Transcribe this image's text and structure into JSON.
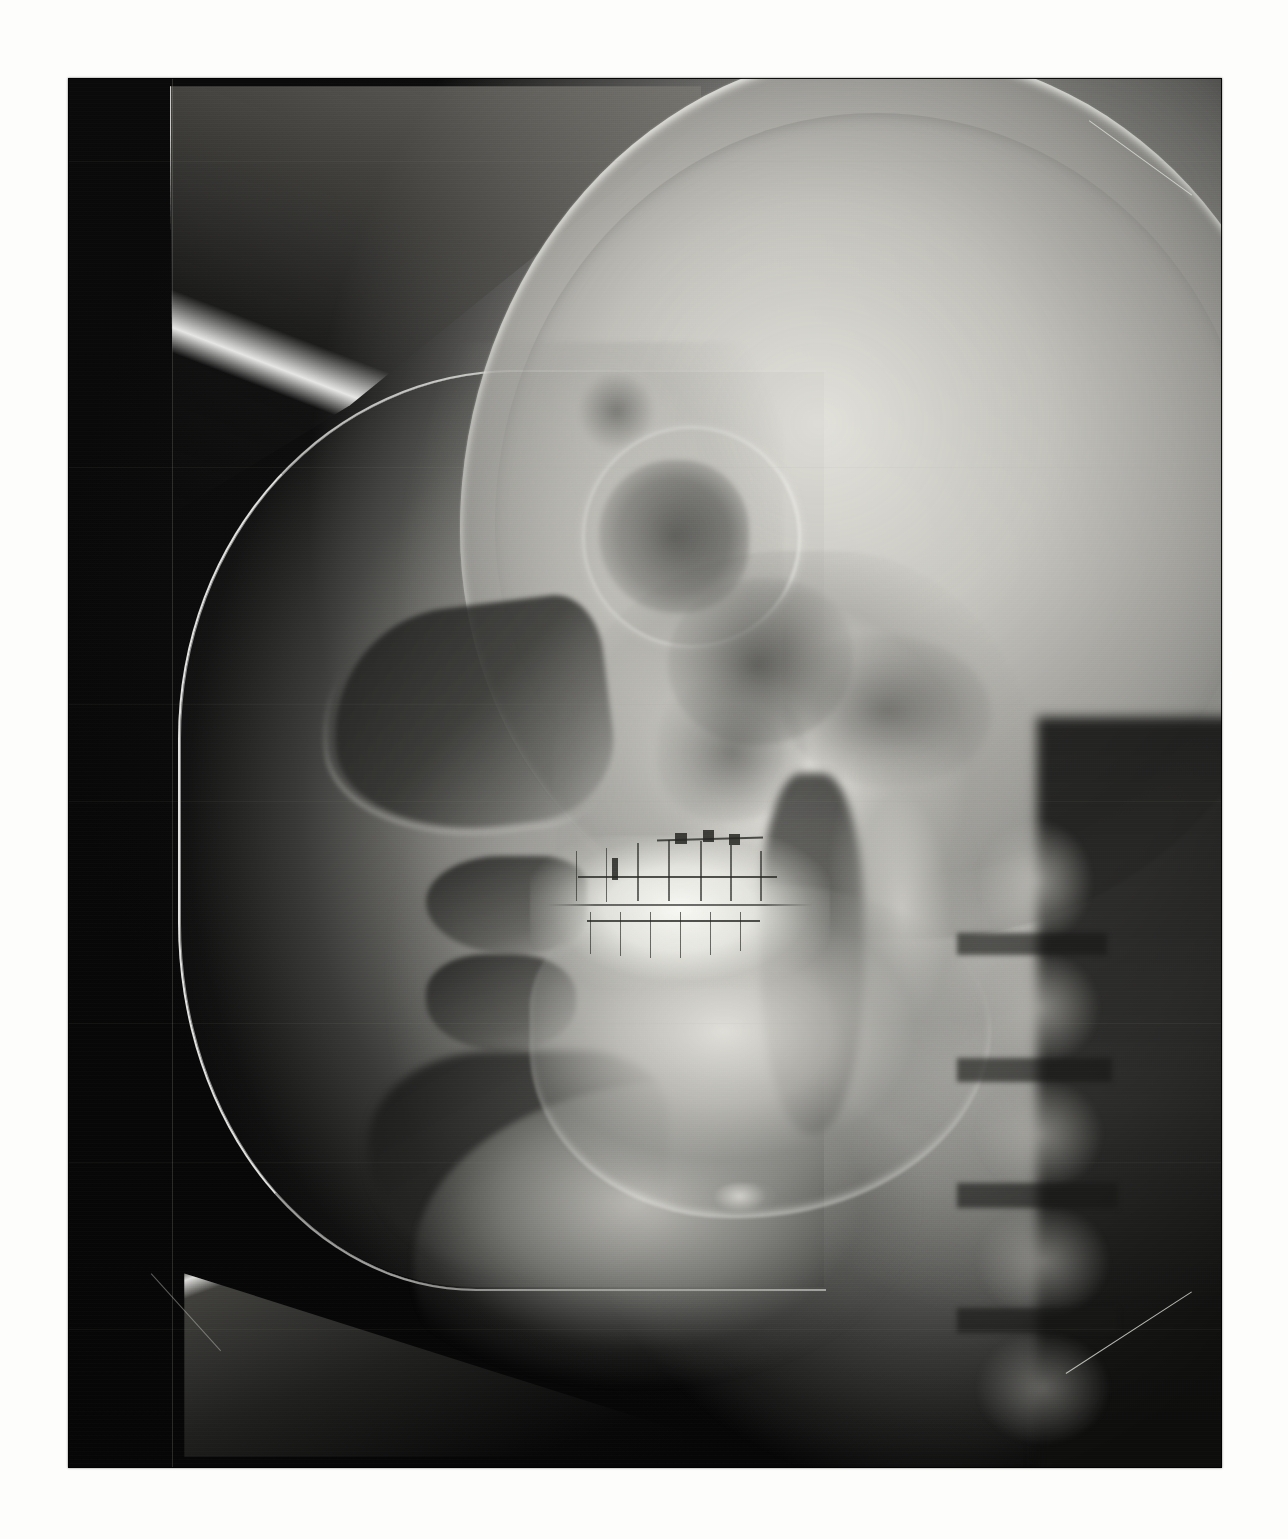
{
  "document": {
    "kind": "radiograph-print",
    "modality": "X-ray",
    "view": "lateral cephalometric",
    "subject": "human skull in profile, facing left",
    "background_color": "#fdfdfb",
    "film_color": "#070707"
  },
  "film": {
    "left": 68,
    "top": 78,
    "width": 1154,
    "height": 1390,
    "border_color": "#000000"
  },
  "palette": {
    "paper_white": "#fdfdfb",
    "film_black": "#070707",
    "deep_shadow": "#0a0a0a",
    "mid_gray": "#969691",
    "bone_gray": "#c4c3bd",
    "bright_bone": "#e8e7e2",
    "enamel_white": "#fcfcf8",
    "collimator_edge": "#f8f8f6"
  },
  "regions": [
    {
      "name": "collimator-upper-wedge",
      "label": "Collimator upper wedge",
      "description": "Bright-edged triangular cut of the collimator shadow across the upper left"
    },
    {
      "name": "collimator-main-arc",
      "label": "Collimator C arc",
      "description": "Large C-shaped bright-bordered field framing the facial soft tissue profile"
    },
    {
      "name": "collimator-lower-wedge",
      "label": "Collimator lower wedge",
      "description": "Lower triangular collimator cut near the bottom left"
    },
    {
      "name": "calvarium",
      "label": "Cranial vault",
      "description": "Large gray dome of the skull occupying the upper right"
    },
    {
      "name": "frontal-sinus",
      "label": "Frontal sinus",
      "description": "Small radiolucent pocket above the orbit"
    },
    {
      "name": "orbit",
      "label": "Orbital cavity",
      "description": "Dark orbital shadow behind the nasal root"
    },
    {
      "name": "sella-turcica",
      "label": "Sella turcica / skull base",
      "description": "Dark central skull-base complex"
    },
    {
      "name": "petrous-ridge",
      "label": "Petrous ridge",
      "description": "Dense posterior skull base structures"
    },
    {
      "name": "maxillary-sinus",
      "label": "Maxillary sinus",
      "description": "Radiolucent triangle above the upper molars"
    },
    {
      "name": "nasopharyngeal-airway",
      "label": "Pharyngeal airway",
      "description": "Dark vertical air column behind the tongue"
    },
    {
      "name": "soft-tissue-profile",
      "label": "Soft tissue profile",
      "description": "Nose, lips and chin outline against the exposed field"
    },
    {
      "name": "nasal-dorsum",
      "label": "Nasal dorsum",
      "description": "Sloping shadow of the nose"
    },
    {
      "name": "upper-lip",
      "label": "Upper lip",
      "description": "Soft tissue shadow above the mouth"
    },
    {
      "name": "lower-lip",
      "label": "Lower lip",
      "description": "Soft tissue shadow below the mouth"
    },
    {
      "name": "chin-shadow",
      "label": "Chin / submental",
      "description": "Shadowed soft tissue under the chin"
    },
    {
      "name": "mandible",
      "label": "Mandible",
      "description": "Bright lower jaw with inferior cortical border"
    },
    {
      "name": "ramus",
      "label": "Mandibular ramus",
      "description": "Vertical branch of the jaw toward the condyle"
    },
    {
      "name": "dentition",
      "label": "Dentition",
      "description": "Bright upper and lower tooth rows in occlusion"
    },
    {
      "name": "orthodontic-wire",
      "label": "Orthodontic appliance",
      "description": "Thin dark arch wire and bracket tracings over the teeth"
    },
    {
      "name": "hyoid-bone",
      "label": "Hyoid bone",
      "description": "Small bright hook-shaped bone in the neck"
    },
    {
      "name": "cervical-spine",
      "label": "Cervical vertebrae",
      "description": "Stacked vertebral bodies down the right side"
    },
    {
      "name": "neck-soft-tissue",
      "label": "Neck soft tissue",
      "description": "Bright sweep of tissue along the throat"
    }
  ],
  "artifacts": {
    "grain": "film grain speckle across the emulsion",
    "scan_banding": "faint horizontal scanner banding in the dark field",
    "creases": [
      {
        "name": "top-right-crease",
        "description": "Diagonal white crease at the top right corner of the print"
      },
      {
        "name": "bottom-right-crease",
        "description": "Diagonal white crease at the bottom right corner of the print"
      },
      {
        "name": "bottom-left-crease",
        "description": "Faint diagonal white crease at the bottom left corner"
      }
    ],
    "seam": "faint vertical collimator seam near the left edge"
  }
}
